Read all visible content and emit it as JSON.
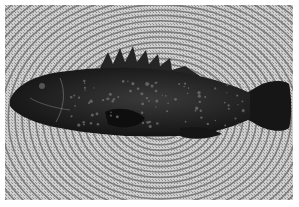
{
  "image": {
    "description": "Grayscale photograph of a spotted grouper fish lying on a round woven rope placemat",
    "subject": "grouper-fish",
    "background": "woven-placemat",
    "colors": {
      "mat_light": "#d8d8d8",
      "mat_dark": "#6a6a6a",
      "fish_body": "#1e1e1e",
      "fish_spots": "#7a7a7a",
      "border": "#ffffff"
    }
  }
}
